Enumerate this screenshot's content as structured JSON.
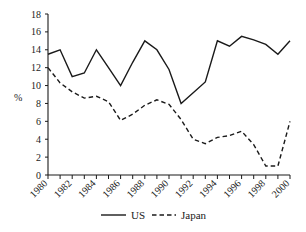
{
  "chart_data": {
    "type": "line",
    "title": "",
    "xlabel": "",
    "ylabel": "%",
    "xlim": [
      1980,
      2000
    ],
    "ylim": [
      0,
      18
    ],
    "ytick_step": 2,
    "xtick_step": 1,
    "grid": false,
    "legend_position": "bottom",
    "x": [
      1980,
      1981,
      1982,
      1983,
      1984,
      1985,
      1986,
      1987,
      1988,
      1989,
      1990,
      1991,
      1992,
      1993,
      1994,
      1995,
      1996,
      1997,
      1998,
      1999,
      2000
    ],
    "ytick_labels": [
      "0",
      "2",
      "4",
      "6",
      "8",
      "10",
      "12",
      "14",
      "16",
      "18"
    ],
    "xtick_labels": [
      "1980",
      "1981",
      "1982",
      "1983",
      "1984",
      "1985",
      "1986",
      "1987",
      "1988",
      "1989",
      "1990",
      "1991",
      "1992",
      "1993",
      "1994",
      "1995",
      "1996",
      "1997",
      "1998",
      "1999",
      "2000"
    ],
    "xtick_labels_shown": [
      "1980",
      "1982",
      "1984",
      "1986",
      "1988",
      "1990",
      "1992",
      "1994",
      "1996",
      "1998",
      "2000"
    ],
    "series": [
      {
        "name": "US",
        "style": "solid",
        "color": "#1a1a1a",
        "values": [
          13.5,
          14.0,
          11.0,
          11.4,
          14.0,
          12.0,
          10.0,
          12.6,
          15.0,
          14.0,
          11.8,
          8.0,
          9.2,
          10.4,
          15.0,
          14.4,
          15.5,
          15.1,
          14.6,
          13.5,
          15.0
        ]
      },
      {
        "name": "Japan",
        "style": "dashed",
        "color": "#1a1a1a",
        "values": [
          12.0,
          10.3,
          9.3,
          8.6,
          8.8,
          8.2,
          6.1,
          6.8,
          7.8,
          8.4,
          7.9,
          6.2,
          4.0,
          3.5,
          4.2,
          4.4,
          4.9,
          3.4,
          1.0,
          1.0,
          6.0
        ]
      }
    ]
  },
  "legend": {
    "items": [
      {
        "label": "US",
        "style": "solid"
      },
      {
        "label": "Japan",
        "style": "dashed"
      }
    ]
  },
  "axes": {
    "y_axis_label": "%"
  }
}
